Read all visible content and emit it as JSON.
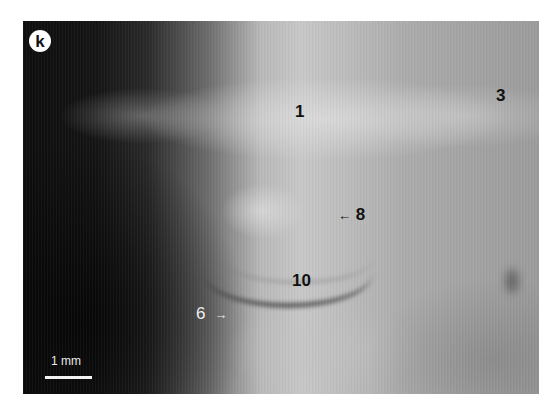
{
  "figure": {
    "panel_letter": "k",
    "labels": [
      {
        "id": "1",
        "text": "1",
        "arrow": null,
        "color": "#111111"
      },
      {
        "id": "3",
        "text": "3",
        "arrow": null,
        "color": "#111111"
      },
      {
        "id": "8",
        "text": "8",
        "arrow": "←",
        "color": "#111111"
      },
      {
        "id": "10",
        "text": "10",
        "arrow": null,
        "color": "#111111"
      },
      {
        "id": "6",
        "text": "6",
        "arrow": "→",
        "color": "#eeeeee"
      }
    ],
    "scale_bar": {
      "label": "1 mm"
    }
  }
}
